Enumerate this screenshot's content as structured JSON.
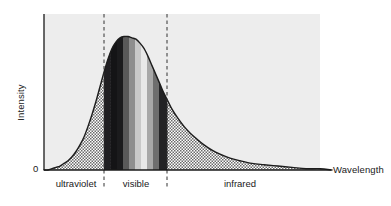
{
  "axes": {
    "y_title": "Intensity",
    "x_title": "Wavelength",
    "y_zero_label": "0"
  },
  "regions": [
    {
      "name": "ultraviolet",
      "label": "ultraviolet",
      "center_x": 76,
      "x_start": 44,
      "x_end": 104
    },
    {
      "name": "visible",
      "label": "visible",
      "center_x": 136,
      "x_start": 104,
      "x_end": 167
    },
    {
      "name": "infrared",
      "label": "infrared",
      "center_x": 240,
      "x_start": 167,
      "x_end": 320
    }
  ],
  "colors": {
    "curve_stroke": "#1c1c1c",
    "panel_background": "#ededed",
    "axis_line": "#1a1a1a",
    "stipple_dot": "#5a5a5a",
    "stipple_base": "#ffffff",
    "dashed_line": "#333333",
    "text": "#1a1a1a"
  },
  "spectrum_bands": [
    {
      "name": "violet-dark",
      "x_start": 104.0,
      "x_end": 110.5,
      "fill": "#201f22"
    },
    {
      "name": "violet",
      "x_start": 110.5,
      "x_end": 117.0,
      "fill": "#141416"
    },
    {
      "name": "blue",
      "x_start": 117.0,
      "x_end": 123.0,
      "fill": "#1b1b1d"
    },
    {
      "name": "cyan",
      "x_start": 123.0,
      "x_end": 129.0,
      "fill": "#595959"
    },
    {
      "name": "green",
      "x_start": 129.0,
      "x_end": 135.0,
      "fill": "#8e8e8e"
    },
    {
      "name": "yellow-green",
      "x_start": 135.0,
      "x_end": 141.0,
      "fill": "#c9c9c9"
    },
    {
      "name": "yellow",
      "x_start": 141.0,
      "x_end": 147.0,
      "fill": "#e8e8e8"
    },
    {
      "name": "orange",
      "x_start": 147.0,
      "x_end": 153.0,
      "fill": "#a8a8a8"
    },
    {
      "name": "red",
      "x_start": 153.0,
      "x_end": 159.0,
      "fill": "#6e6e6e"
    },
    {
      "name": "deep-red",
      "x_start": 159.0,
      "x_end": 167.0,
      "fill": "#232325"
    }
  ],
  "chart_data": {
    "type": "area",
    "title": "",
    "xlabel": "Wavelength",
    "ylabel": "Intensity",
    "grid": false,
    "legend": null,
    "xtick_labels": [],
    "ytick_labels": [
      "0"
    ],
    "annotations": [
      "ultraviolet",
      "visible",
      "infrared"
    ],
    "series": [
      {
        "name": "spectral-intensity",
        "x": [
          44,
          48,
          52,
          56,
          60,
          64,
          68,
          72,
          76,
          80,
          84,
          88,
          92,
          96,
          100,
          104,
          108,
          112,
          116,
          120,
          124,
          128,
          132,
          136,
          140,
          144,
          148,
          152,
          156,
          160,
          164,
          168,
          172,
          178,
          184,
          190,
          196,
          204,
          212,
          220,
          230,
          240,
          252,
          264,
          278,
          292,
          306,
          320,
          332
        ],
        "y": [
          0,
          0,
          1,
          2,
          3,
          5,
          7,
          10,
          14,
          19,
          25,
          33,
          42,
          52,
          63,
          74,
          84,
          92,
          97,
          100,
          101,
          101,
          100,
          99,
          96,
          92,
          86,
          79,
          72,
          65,
          58,
          52,
          46,
          39,
          33,
          28,
          24,
          19,
          15,
          12,
          9,
          7,
          5,
          4,
          3,
          2,
          1,
          1,
          0
        ]
      }
    ],
    "ylim": [
      0,
      112
    ],
    "xlim": [
      44,
      332
    ],
    "boundaries": [
      {
        "name": "uv-visible-boundary",
        "x": 104
      },
      {
        "name": "visible-ir-boundary",
        "x": 167
      }
    ]
  }
}
